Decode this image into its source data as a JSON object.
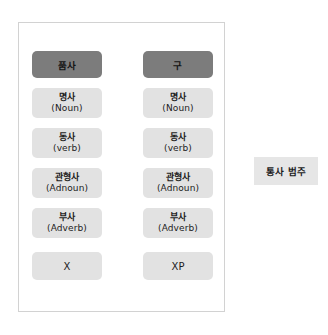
{
  "diagram": {
    "type": "two-column-category-chart",
    "panel": {
      "columns": [
        {
          "id": "part-of-speech",
          "header": "품사",
          "items": [
            {
              "kr": "명사",
              "en": "(Noun)"
            },
            {
              "kr": "동사",
              "en": "(verb)"
            },
            {
              "kr": "관형사",
              "en": "(Adnoun)"
            },
            {
              "kr": "부사",
              "en": "(Adverb)"
            },
            {
              "kr": "X",
              "en": ""
            }
          ]
        },
        {
          "id": "phrase",
          "header": "구",
          "items": [
            {
              "kr": "명사",
              "en": "(Noun)"
            },
            {
              "kr": "동사",
              "en": "(verb)"
            },
            {
              "kr": "관형사",
              "en": "(Adnoun)"
            },
            {
              "kr": "부사",
              "en": "(Adverb)"
            },
            {
              "kr": "XP",
              "en": ""
            }
          ]
        }
      ]
    },
    "side_label": "통사 범주",
    "colors": {
      "header_pill": "#7c7c7c",
      "item_pill": "#e2e2e2",
      "side_box": "#e6e6e6",
      "panel_border": "#d2d2d2",
      "text": "#1c1c1c",
      "background": "#ffffff"
    }
  }
}
